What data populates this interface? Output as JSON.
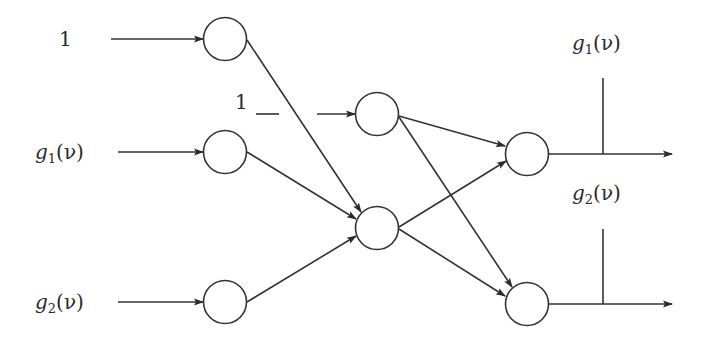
{
  "diagram": {
    "type": "neural-network",
    "stroke_color": "#333333",
    "inputs": [
      {
        "id": "in-1",
        "label": "1"
      },
      {
        "id": "in-g1",
        "label_fn": "g",
        "label_sub": "1",
        "label_arg": "(ν)"
      },
      {
        "id": "in-g2",
        "label_fn": "g",
        "label_sub": "2",
        "label_arg": "(ν)"
      }
    ],
    "bias_label": "1",
    "outputs": [
      {
        "id": "out-g1",
        "label_fn": "g",
        "label_sub": "1",
        "label_arg": "(ν)"
      },
      {
        "id": "out-g2",
        "label_fn": "g",
        "label_sub": "2",
        "label_arg": "(ν)"
      }
    ],
    "nodes": [
      {
        "id": "L1-a",
        "layer": 1,
        "cx": 225,
        "cy": 39
      },
      {
        "id": "L1-b",
        "layer": 1,
        "cx": 225,
        "cy": 152
      },
      {
        "id": "L1-c",
        "layer": 1,
        "cx": 225,
        "cy": 302
      },
      {
        "id": "L2-a",
        "layer": 2,
        "cx": 377,
        "cy": 114
      },
      {
        "id": "L2-b",
        "layer": 2,
        "cx": 377,
        "cy": 228
      },
      {
        "id": "L3-a",
        "layer": 3,
        "cx": 527,
        "cy": 154
      },
      {
        "id": "L3-b",
        "layer": 3,
        "cx": 527,
        "cy": 304
      }
    ],
    "edges": [
      [
        "in-1",
        "L1-a"
      ],
      [
        "in-g1",
        "L1-b"
      ],
      [
        "in-g2",
        "L1-c"
      ],
      [
        "bias",
        "L2-a"
      ],
      [
        "L1-a",
        "L2-b"
      ],
      [
        "L1-b",
        "L2-b"
      ],
      [
        "L1-c",
        "L2-b"
      ],
      [
        "L2-a",
        "L3-a"
      ],
      [
        "L2-a",
        "L3-b"
      ],
      [
        "L2-b",
        "L3-a"
      ],
      [
        "L2-b",
        "L3-b"
      ],
      [
        "L3-a",
        "out-g1"
      ],
      [
        "L3-b",
        "out-g2"
      ]
    ]
  }
}
